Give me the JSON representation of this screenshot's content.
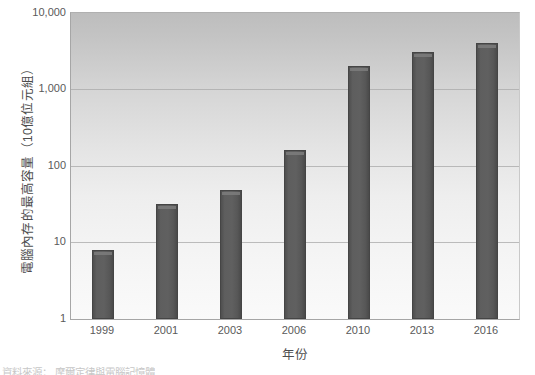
{
  "chart_data": {
    "type": "bar",
    "title": "",
    "categories": [
      "1999",
      "2001",
      "2003",
      "2006",
      "2010",
      "2013",
      "2016"
    ],
    "values": [
      8,
      32,
      48,
      160,
      2048,
      3072,
      4096
    ],
    "series": [
      {
        "name": "電腦內存的最高容量",
        "values": [
          8,
          32,
          48,
          160,
          2048,
          3072,
          4096
        ]
      }
    ],
    "xlabel": "年份",
    "ylabel": "電腦內存的最高容量（10億位元組）",
    "yscale": "log",
    "ylim": [
      1,
      10000
    ],
    "ytick_labels": [
      "1",
      "10",
      "100",
      "1,000",
      "10,000"
    ],
    "ytick_values": [
      1,
      10,
      100,
      1000,
      10000
    ],
    "grid": true,
    "legend": "none",
    "bar_color": "#5a5a5a",
    "plot_bg_top_color": "#bdbdbd",
    "plot_bg_bottom_color": "#fafafa",
    "gridline_color": "#a8a8a8"
  },
  "footer": {
    "source_text": "資料來源： 摩爾定律與電腦記憶體"
  }
}
